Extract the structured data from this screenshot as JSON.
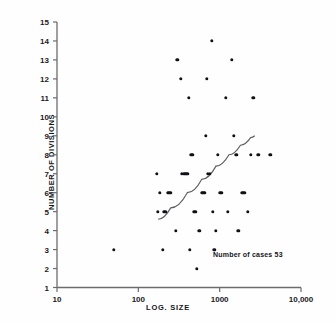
{
  "chart_data": {
    "type": "scatter",
    "title": "",
    "xlabel": "LOG. SIZE",
    "ylabel": "NUMBER OF DIVISIONS",
    "xscale": "log",
    "xlim": [
      10,
      10000
    ],
    "ylim": [
      1,
      15
    ],
    "xticks": [
      10,
      100,
      1000,
      10000
    ],
    "xtick_labels": [
      "10",
      "100",
      "1000",
      "10,000"
    ],
    "yticks": [
      1,
      2,
      3,
      4,
      5,
      6,
      7,
      8,
      9,
      10,
      11,
      12,
      13,
      14,
      15
    ],
    "ytick_labels": [
      "1",
      "2",
      "3",
      "4",
      "5",
      "6",
      "7",
      "8",
      "9",
      "10",
      "11",
      "12",
      "13",
      "14",
      "15"
    ],
    "grid": false,
    "legend": false,
    "annotation": "Number of cases 53",
    "n_cases": 53,
    "marker_color": "#111115",
    "axis_color": "#6b6b70",
    "points": [
      [
        50,
        3
      ],
      [
        170,
        7
      ],
      [
        175,
        5
      ],
      [
        185,
        6
      ],
      [
        200,
        3
      ],
      [
        205,
        5
      ],
      [
        215,
        5
      ],
      [
        230,
        6
      ],
      [
        240,
        6
      ],
      [
        250,
        6
      ],
      [
        290,
        4
      ],
      [
        300,
        13
      ],
      [
        330,
        12
      ],
      [
        340,
        7
      ],
      [
        360,
        7
      ],
      [
        380,
        7
      ],
      [
        400,
        7
      ],
      [
        420,
        11
      ],
      [
        430,
        3
      ],
      [
        450,
        8
      ],
      [
        470,
        8
      ],
      [
        480,
        5
      ],
      [
        500,
        5
      ],
      [
        520,
        2
      ],
      [
        560,
        4
      ],
      [
        600,
        6
      ],
      [
        620,
        6
      ],
      [
        640,
        6
      ],
      [
        660,
        6
      ],
      [
        680,
        9
      ],
      [
        700,
        12
      ],
      [
        720,
        7
      ],
      [
        760,
        7
      ],
      [
        800,
        14
      ],
      [
        820,
        5
      ],
      [
        860,
        3
      ],
      [
        900,
        4
      ],
      [
        950,
        8
      ],
      [
        1000,
        6
      ],
      [
        1050,
        6
      ],
      [
        1200,
        11
      ],
      [
        1250,
        5
      ],
      [
        1400,
        13
      ],
      [
        1500,
        9
      ],
      [
        1600,
        8
      ],
      [
        1700,
        4
      ],
      [
        1900,
        6
      ],
      [
        2000,
        6
      ],
      [
        2200,
        5
      ],
      [
        2400,
        8
      ],
      [
        2600,
        11
      ],
      [
        3000,
        8
      ],
      [
        4200,
        8
      ]
    ],
    "fit_curve": {
      "label": "fitted trend",
      "points": [
        [
          175,
          4.6
        ],
        [
          250,
          5.2
        ],
        [
          400,
          6.0
        ],
        [
          600,
          6.7
        ],
        [
          900,
          7.4
        ],
        [
          1300,
          8.0
        ],
        [
          1800,
          8.5
        ],
        [
          2400,
          8.9
        ],
        [
          2700,
          9.0
        ]
      ]
    }
  }
}
